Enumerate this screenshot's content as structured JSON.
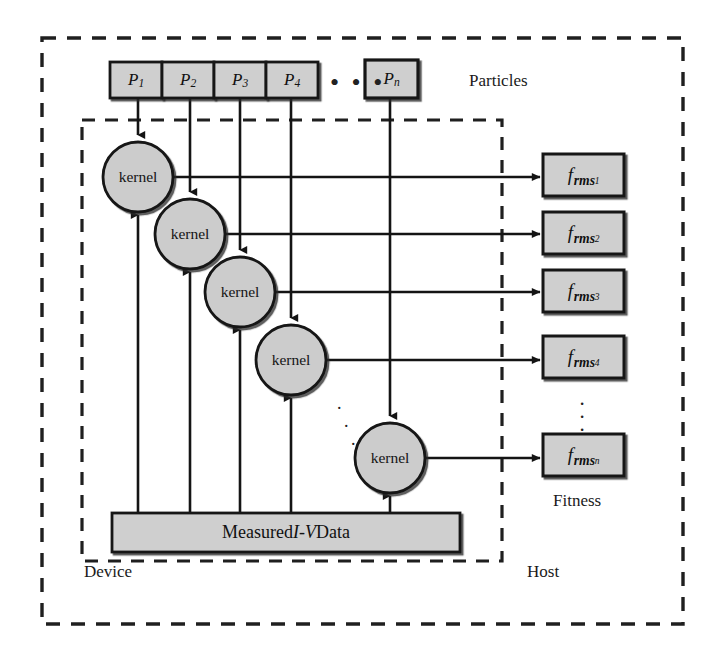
{
  "diagram": {
    "outer_region_label": "Host",
    "inner_region_label": "Device",
    "particles_label": "Particles",
    "fitness_label": "Fitness",
    "data_block_label_prefix": "Measured ",
    "data_block_label_italic": "I-V",
    "data_block_label_suffix": " Data",
    "kernel_label": "kernel",
    "horizontal_ellipsis": "• • •",
    "colors": {
      "box_fill": "#cfcfcf",
      "box_stroke": "#141414",
      "circle_fill": "#cccccc",
      "circle_stroke": "#141414",
      "dashed_stroke": "#1f1f1f",
      "arrow_stroke": "#141414",
      "background": "#ffffff",
      "text": "#111111"
    },
    "particles": [
      {
        "base": "P",
        "sub": "1",
        "x": 110,
        "y": 62,
        "w": 52,
        "h": 36
      },
      {
        "base": "P",
        "sub": "2",
        "x": 162,
        "y": 62,
        "w": 52,
        "h": 36
      },
      {
        "base": "P",
        "sub": "3",
        "x": 214,
        "y": 62,
        "w": 52,
        "h": 36
      },
      {
        "base": "P",
        "sub": "4",
        "x": 266,
        "y": 62,
        "w": 52,
        "h": 36
      },
      {
        "base": "P",
        "sub": "n",
        "x": 365,
        "y": 60,
        "w": 53,
        "h": 38
      }
    ],
    "kernels": [
      {
        "label": "kernel",
        "cx": 138,
        "cy": 177,
        "r": 35
      },
      {
        "label": "kernel",
        "cx": 190,
        "cy": 234,
        "r": 35
      },
      {
        "label": "kernel",
        "cx": 240,
        "cy": 292,
        "r": 35
      },
      {
        "label": "kernel",
        "cx": 291,
        "cy": 360,
        "r": 35
      },
      {
        "label": "kernel",
        "cx": 390,
        "cy": 458,
        "r": 35
      }
    ],
    "fitness": [
      {
        "base": "f",
        "sub": "rms",
        "idx": "1",
        "x": 543,
        "y": 154,
        "w": 81,
        "h": 42
      },
      {
        "base": "f",
        "sub": "rms",
        "idx": "2",
        "x": 543,
        "y": 212,
        "w": 81,
        "h": 42
      },
      {
        "base": "f",
        "sub": "rms",
        "idx": "3",
        "x": 543,
        "y": 270,
        "w": 81,
        "h": 42
      },
      {
        "base": "f",
        "sub": "rms",
        "idx": "4",
        "x": 543,
        "y": 336,
        "w": 81,
        "h": 42
      },
      {
        "base": "f",
        "sub": "rms",
        "idx": "n",
        "x": 543,
        "y": 434,
        "w": 81,
        "h": 42
      }
    ],
    "data_block": {
      "x": 112,
      "y": 513,
      "w": 348,
      "h": 39
    },
    "outer_region": {
      "x": 42,
      "y": 38,
      "w": 641,
      "h": 586
    },
    "inner_region": {
      "x": 82,
      "y": 120,
      "w": 420,
      "h": 441
    }
  }
}
